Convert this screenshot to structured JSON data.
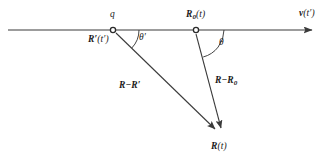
{
  "figure": {
    "background_color": "#ffffff",
    "stroke_color": "#3a3a3a",
    "text_color": "#1a1a1a",
    "width": 334,
    "height": 162
  },
  "labels": {
    "charge": "q",
    "retarded_position": "R'(t')",
    "retarded_position_parts": {
      "vector": "R",
      "prime": "′",
      "arg": "(t′)"
    },
    "present_position": "R₀(t)",
    "present_position_parts": {
      "vector": "R",
      "subscript": "0",
      "arg": "(t)"
    },
    "velocity": "v(t')",
    "velocity_parts": {
      "vector": "v",
      "arg": "(t′)"
    },
    "angle_retarded": "θ′",
    "angle_present": "θ",
    "separation_retarded": "R−R′",
    "separation_retarded_parts": {
      "first": "R",
      "minus": "−",
      "second": "R",
      "prime": "′"
    },
    "separation_present": "R−R₀",
    "separation_present_parts": {
      "first": "R",
      "minus": "−",
      "second": "R",
      "subscript": "0"
    },
    "field_point": "R(t)",
    "field_point_parts": {
      "vector": "R",
      "arg": "(t)"
    }
  },
  "geometry": {
    "trajectory_line": {
      "x1": 8,
      "y1": 30,
      "x2": 320,
      "y2": 30,
      "arrowhead": "right"
    },
    "marker_charge": {
      "cx": 113,
      "cy": 30,
      "r": 2.6,
      "style": "open-circle"
    },
    "marker_present": {
      "cx": 196,
      "cy": 30,
      "r": 2.6,
      "style": "open-circle"
    },
    "vector_retarded": {
      "x1": 115,
      "y1": 32,
      "x2": 221,
      "y2": 134,
      "arrowhead": "end"
    },
    "vector_present": {
      "x1": 196,
      "y1": 33,
      "x2": 222,
      "y2": 133,
      "arrowhead": "end"
    },
    "arc_retarded": {
      "cx": 113,
      "cy": 30,
      "radius": 26,
      "from_deg": 0,
      "to_deg": 44
    },
    "arc_present": {
      "cx": 196,
      "cy": 30,
      "radius": 28,
      "from_deg": 0,
      "to_deg": 75
    },
    "convergence_point": {
      "x": 222,
      "y": 135
    }
  }
}
